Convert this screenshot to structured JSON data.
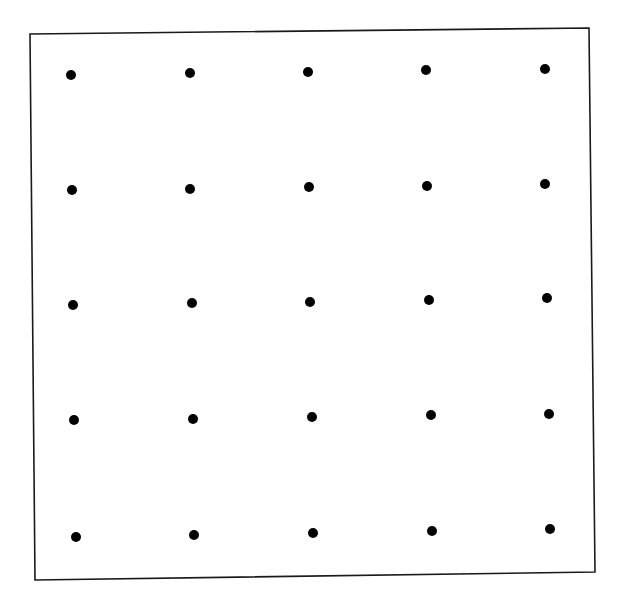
{
  "diagram": {
    "type": "dot-grid",
    "rows": 5,
    "cols": 5,
    "background": "#ffffff",
    "stroke_color": "#1a1a1a",
    "dot_color": "#000000",
    "dot_radius": 5,
    "frame": {
      "corners": [
        [
          30,
          34
        ],
        [
          589,
          28
        ],
        [
          595,
          572
        ],
        [
          35,
          580
        ]
      ]
    },
    "dots": [
      [
        [
          71,
          75
        ],
        [
          190,
          73
        ],
        [
          308,
          72
        ],
        [
          426,
          70
        ],
        [
          545,
          69
        ]
      ],
      [
        [
          72,
          190
        ],
        [
          190,
          189
        ],
        [
          309,
          187
        ],
        [
          427,
          186
        ],
        [
          545,
          184
        ]
      ],
      [
        [
          73,
          305
        ],
        [
          192,
          303
        ],
        [
          310,
          302
        ],
        [
          429,
          300
        ],
        [
          547,
          298
        ]
      ],
      [
        [
          74,
          420
        ],
        [
          193,
          419
        ],
        [
          312,
          417
        ],
        [
          431,
          415
        ],
        [
          549,
          414
        ]
      ],
      [
        [
          76,
          537
        ],
        [
          194,
          535
        ],
        [
          313,
          533
        ],
        [
          432,
          531
        ],
        [
          550,
          529
        ]
      ]
    ]
  }
}
